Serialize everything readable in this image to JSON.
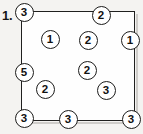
{
  "problem": {
    "number_label": "1.",
    "figure_name": "counting-circles-rectangle"
  },
  "box": {
    "x": 21,
    "y": 11,
    "width": 114,
    "height": 110,
    "border_color": "#20201f",
    "fill_color": "#fefefe"
  },
  "page": {
    "background_color": "#f2f1ef",
    "text_color": "#111111"
  },
  "chart_data": {
    "type": "scatter",
    "title": "1.",
    "xlabel": "",
    "ylabel": "",
    "xlim": [
      0,
      114
    ],
    "ylim": [
      0,
      110
    ],
    "grid": false,
    "legend": "none",
    "annotation": "Numbered circles placed inside and on the edges of a rectangle",
    "point_count": 13,
    "points": [
      {
        "label": "3",
        "x": 24,
        "y": 12
      },
      {
        "label": "2",
        "x": 101,
        "y": 15
      },
      {
        "label": "1",
        "x": 50,
        "y": 39
      },
      {
        "label": "2",
        "x": 88,
        "y": 40
      },
      {
        "label": "1",
        "x": 130,
        "y": 40
      },
      {
        "label": "5",
        "x": 24,
        "y": 72
      },
      {
        "label": "2",
        "x": 87,
        "y": 70
      },
      {
        "label": "2",
        "x": 45,
        "y": 89
      },
      {
        "label": "3",
        "x": 106,
        "y": 90
      },
      {
        "label": "3",
        "x": 24,
        "y": 118
      },
      {
        "label": "3",
        "x": 68,
        "y": 119
      },
      {
        "label": "3",
        "x": 131,
        "y": 119
      }
    ],
    "values": [
      3,
      2,
      1,
      2,
      1,
      5,
      2,
      2,
      3,
      3,
      3,
      3
    ],
    "categories": [
      "3",
      "2",
      "1",
      "2",
      "1",
      "5",
      "2",
      "2",
      "3",
      "3",
      "3",
      "3"
    ]
  }
}
